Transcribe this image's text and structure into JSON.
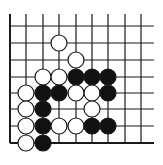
{
  "diagram": {
    "type": "go-board-fragment",
    "colors": {
      "background": "#ffffff",
      "line": "#1a1a1a",
      "black_stone": "#111111",
      "white_stone": "#ffffff",
      "stone_outline": "#1a1a1a"
    },
    "grid": {
      "columns_x": [
        10,
        26,
        43,
        59,
        76,
        92,
        108,
        125,
        141
      ],
      "rows_y": [
        26,
        43,
        60,
        77,
        93,
        109,
        126,
        143
      ],
      "vertical_top": 14,
      "horizontal_right": 154,
      "left_edge": true,
      "bottom_edge": true
    },
    "stone_radius": 8,
    "stones": [
      {
        "color": "white",
        "col": 3,
        "row": 1
      },
      {
        "color": "white",
        "col": 4,
        "row": 2
      },
      {
        "color": "white",
        "col": 2,
        "row": 3
      },
      {
        "color": "white",
        "col": 3,
        "row": 3
      },
      {
        "color": "black",
        "col": 4,
        "row": 3
      },
      {
        "color": "black",
        "col": 5,
        "row": 3
      },
      {
        "color": "black",
        "col": 6,
        "row": 3
      },
      {
        "color": "white",
        "col": 1,
        "row": 4
      },
      {
        "color": "black",
        "col": 2,
        "row": 4
      },
      {
        "color": "black",
        "col": 3,
        "row": 4
      },
      {
        "color": "white",
        "col": 4,
        "row": 4
      },
      {
        "color": "white",
        "col": 5,
        "row": 4
      },
      {
        "color": "black",
        "col": 6,
        "row": 4
      },
      {
        "color": "white",
        "col": 1,
        "row": 5
      },
      {
        "color": "black",
        "col": 2,
        "row": 5
      },
      {
        "color": "white",
        "col": 5,
        "row": 5
      },
      {
        "color": "white",
        "col": 1,
        "row": 6
      },
      {
        "color": "black",
        "col": 2,
        "row": 6
      },
      {
        "color": "white",
        "col": 3,
        "row": 6
      },
      {
        "color": "white",
        "col": 4,
        "row": 6
      },
      {
        "color": "black",
        "col": 5,
        "row": 6
      },
      {
        "color": "black",
        "col": 6,
        "row": 6
      },
      {
        "color": "white",
        "col": 1,
        "row": 7
      },
      {
        "color": "black",
        "col": 2,
        "row": 7
      }
    ]
  }
}
